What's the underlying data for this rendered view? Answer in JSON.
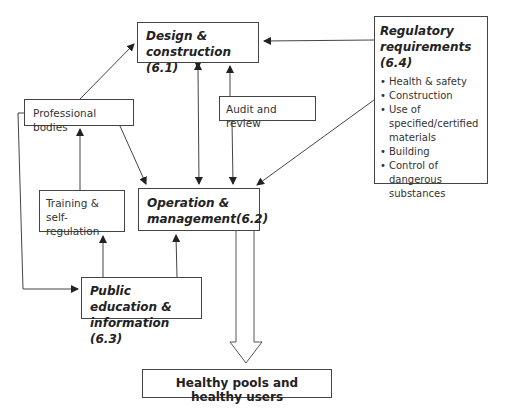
{
  "nodes": {
    "design": {
      "title": "Design & construction (6.1)"
    },
    "regulatory": {
      "title": "Regulatory requirements (6.4)",
      "items": [
        "Health & safety",
        "Construction",
        "Use of specified/certified materials",
        "Building",
        "Control of dangerous substances"
      ]
    },
    "professional": {
      "label": "Professional bodies"
    },
    "audit": {
      "label": "Audit and review"
    },
    "training": {
      "label": "Training & self-regulation"
    },
    "operation": {
      "title": "Operation & management(6.2)"
    },
    "public": {
      "title": "Public education & information (6.3)"
    },
    "outcome": {
      "label": "Healthy pools and healthy users"
    }
  },
  "edges": [
    {
      "from": "professional",
      "to": "design"
    },
    {
      "from": "professional",
      "to": "operation"
    },
    {
      "from": "professional",
      "to": "public"
    },
    {
      "from": "regulatory",
      "to": "design"
    },
    {
      "from": "regulatory",
      "to": "operation"
    },
    {
      "from": "design",
      "to": "operation",
      "bidirectional": true
    },
    {
      "from": "audit",
      "to": "design"
    },
    {
      "from": "audit",
      "to": "operation"
    },
    {
      "from": "training",
      "to": "professional"
    },
    {
      "from": "public",
      "to": "training"
    },
    {
      "from": "public",
      "to": "operation"
    },
    {
      "from": "operation",
      "to": "outcome",
      "style": "hollow-block-arrow"
    }
  ]
}
